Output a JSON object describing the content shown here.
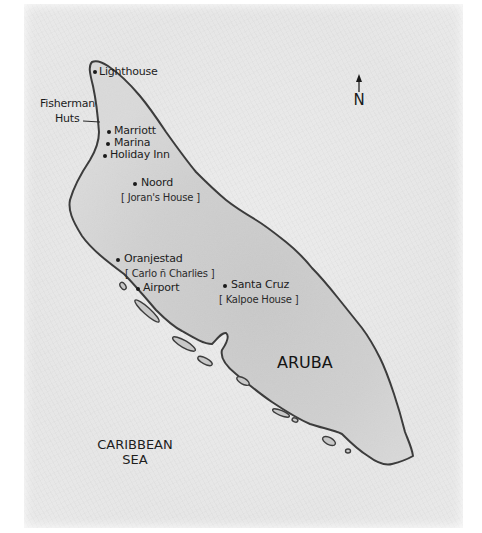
{
  "map": {
    "island_name": "ARUBA",
    "sea_label_line1": "CARIBBEAN",
    "sea_label_line2": "SEA",
    "north_label": "N",
    "colors": {
      "paper": "#e8e8e8",
      "land": "#d2d2d2",
      "coastline": "#3a3a3a",
      "text": "#1c1c1c"
    },
    "places": [
      {
        "name": "Lighthouse",
        "note": ""
      },
      {
        "name": "Marriott",
        "note": ""
      },
      {
        "name": "Marina",
        "note": ""
      },
      {
        "name": "Holiday Inn",
        "note": ""
      },
      {
        "name": "Noord",
        "note": "[ Joran's House ]"
      },
      {
        "name": "Oranjestad",
        "note": "[ Carlo ñ Charlies ]"
      },
      {
        "name": "Airport",
        "note": ""
      },
      {
        "name": "Santa Cruz",
        "note": "[ Kalpoe House ]"
      }
    ],
    "callout": {
      "line1": "Fisherman",
      "line2": "Huts"
    }
  }
}
